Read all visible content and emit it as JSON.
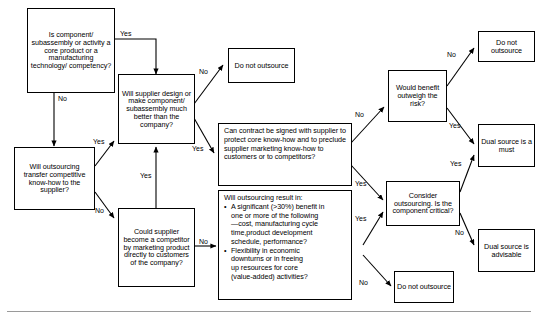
{
  "diagram": {
    "type": "flowchart",
    "colors": {
      "line": "#000000",
      "box_border": "#000000",
      "background": "#ffffff",
      "rule": "#9a9a9a"
    },
    "nodes": [
      {
        "id": "core",
        "kind": "decision",
        "text": "Is component/ subassembly or activity a core product or a manufacturing technology/ competency?",
        "lines": [
          "Is component/",
          "subassembly or",
          "activity a core",
          "product or a",
          "manufacturing",
          "technology/",
          "competency?"
        ]
      },
      {
        "id": "supplier_better",
        "kind": "decision",
        "text": "Will supplier design or make component/ subassembly much better than the company?",
        "lines": [
          "Will supplier",
          "design or make",
          "component/",
          "subassembly",
          "much better than",
          "the company?"
        ]
      },
      {
        "id": "transfer_knowhow",
        "kind": "decision",
        "text": "Will outsourcing transfer competitive know-how to the supplier?",
        "lines": [
          "Will outsourcing",
          "transfer",
          "competitive",
          "know-how to",
          "the supplier?"
        ]
      },
      {
        "id": "become_competitor",
        "kind": "decision",
        "text": "Could supplier become a competitor by marketing product directly to customers of the company?",
        "lines": [
          "Could supplier",
          "become a",
          "competitor by",
          "marketing",
          "product directly",
          "to customers of",
          "the company?"
        ]
      },
      {
        "id": "contract",
        "kind": "decision",
        "text": "Can contract be signed with supplier to protect core know-how and to preclude supplier marketing know-how to customers or to competitors?",
        "lines": [
          "Can contract be signed with",
          "supplier to protect core",
          "know-how and to preclude",
          "supplier marketing know-how",
          "to customers or to competitors?"
        ]
      },
      {
        "id": "result_in",
        "kind": "decision",
        "heading": "Will outsourcing result in:",
        "bullets": [
          [
            "A significant (>30%) benefit in",
            "one or more of the following",
            "—cost, manufacturing cycle",
            "time,product development",
            "schedule, performance?"
          ],
          [
            "Flexibility in economic",
            "downturns or in freeing",
            "up resources for core",
            "(value-added) activities?"
          ]
        ]
      },
      {
        "id": "benefit_risk",
        "kind": "decision",
        "text": "Would benefit outweigh the risk?",
        "lines": [
          "Would",
          "benefit",
          "outweigh",
          "the risk?"
        ]
      },
      {
        "id": "consider",
        "kind": "decision",
        "text": "Consider outsourcing. Is the component critical?",
        "lines": [
          "Consider",
          "outsourcing. Is",
          "the component",
          "critical?"
        ]
      },
      {
        "id": "donot_top",
        "kind": "terminal",
        "text": "Do not outsource",
        "lines": [
          "Do not",
          "outsource"
        ]
      },
      {
        "id": "donot_right",
        "kind": "terminal",
        "text": "Do not outsource",
        "lines": [
          "Do not",
          "outsource"
        ]
      },
      {
        "id": "donot_bottom",
        "kind": "terminal",
        "text": "Do not outsource",
        "lines": [
          "Do not",
          "outsource"
        ]
      },
      {
        "id": "dual_must",
        "kind": "terminal",
        "text": "Dual source is a must",
        "lines": [
          "Dual",
          "source is",
          "a must"
        ]
      },
      {
        "id": "dual_advisable",
        "kind": "terminal",
        "text": "Dual source is advisable",
        "lines": [
          "Dual",
          "source is",
          "advisable"
        ]
      }
    ],
    "edge_labels": {
      "core_yes": "Yes",
      "core_no": "No",
      "supplier_better_no": "No",
      "supplier_better_yes": "Yes",
      "transfer_yes": "Yes",
      "transfer_no": "No",
      "competitor_yes": "Yes",
      "competitor_no": "No",
      "contract_no": "No",
      "contract_yes": "Yes",
      "result_yes": "Yes",
      "result_no": "No",
      "benefit_no": "No",
      "benefit_yes": "Yes",
      "consider_yes": "Yes",
      "consider_no": "No"
    }
  }
}
